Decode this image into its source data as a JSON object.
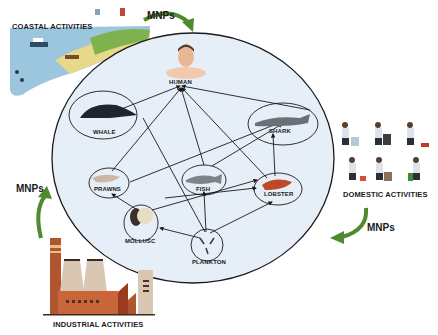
{
  "diagram": {
    "sources": [
      {
        "id": "coastal",
        "label": "COASTAL ACTIVITIES"
      },
      {
        "id": "domestic",
        "label": "DOMESTIC ACTIVITIES"
      },
      {
        "id": "industrial",
        "label": "INDUSTRIAL ACTIVITIES"
      }
    ],
    "flow_label": "MNPs",
    "arrows": [
      {
        "from": "coastal",
        "to": "food_web",
        "label": "MNPs"
      },
      {
        "from": "domestic",
        "to": "food_web",
        "label": "MNPs"
      },
      {
        "from": "industrial",
        "to": "food_web",
        "label": "MNPs"
      }
    ],
    "nodes": [
      {
        "id": "human",
        "label": "HUMAN"
      },
      {
        "id": "whale",
        "label": "WHALE"
      },
      {
        "id": "shark",
        "label": "SHARK"
      },
      {
        "id": "prawns",
        "label": "PRAWNS"
      },
      {
        "id": "fish",
        "label": "FISH"
      },
      {
        "id": "lobster",
        "label": "LOBSTER"
      },
      {
        "id": "mollusc",
        "label": "MOLLUSC"
      },
      {
        "id": "plankton",
        "label": "PLANKTON"
      }
    ],
    "edges": [
      {
        "from": "whale",
        "to": "human"
      },
      {
        "from": "shark",
        "to": "human"
      },
      {
        "from": "fish",
        "to": "human"
      },
      {
        "from": "prawns",
        "to": "human"
      },
      {
        "from": "lobster",
        "to": "human"
      },
      {
        "from": "whale",
        "to": "plankton"
      },
      {
        "from": "prawns",
        "to": "shark"
      },
      {
        "from": "fish",
        "to": "shark"
      },
      {
        "from": "lobster",
        "to": "shark"
      },
      {
        "from": "mollusc",
        "to": "prawns"
      },
      {
        "from": "mollusc",
        "to": "lobster"
      },
      {
        "from": "plankton",
        "to": "fish"
      },
      {
        "from": "plankton",
        "to": "lobster"
      },
      {
        "from": "plankton",
        "to": "mollusc"
      },
      {
        "from": "fish",
        "to": "lobster"
      }
    ],
    "colors": {
      "circle_fill": "#e6eef7",
      "circle_stroke": "#1a1a1a",
      "arrow_green": "#4e8a2e",
      "factory_brick": "#c8663a",
      "factory_tower": "#d9c7b4"
    }
  }
}
